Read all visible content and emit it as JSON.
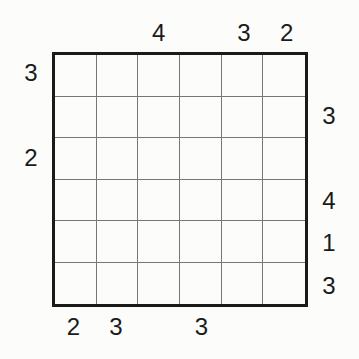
{
  "puzzle": {
    "type": "skyscraper",
    "size": 6,
    "clues": {
      "top": [
        "",
        "",
        "4",
        "",
        "3",
        "2"
      ],
      "bottom": [
        "2",
        "3",
        "",
        "3",
        "",
        ""
      ],
      "left": [
        "3",
        "",
        "2",
        "",
        "",
        ""
      ],
      "right": [
        "",
        "3",
        "",
        "4",
        "1",
        "3"
      ]
    },
    "cells": [
      [
        "",
        "",
        "",
        "",
        "",
        ""
      ],
      [
        "",
        "",
        "",
        "",
        "",
        ""
      ],
      [
        "",
        "",
        "",
        "",
        "",
        ""
      ],
      [
        "",
        "",
        "",
        "",
        "",
        ""
      ],
      [
        "",
        "",
        "",
        "",
        "",
        ""
      ],
      [
        "",
        "",
        "",
        "",
        "",
        ""
      ]
    ]
  }
}
